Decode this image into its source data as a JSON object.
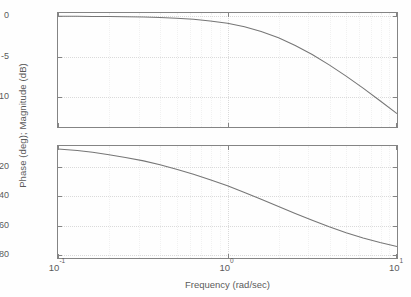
{
  "figure": {
    "ylabel": "Phase (deg); Magnitude (dB)",
    "xlabel": "Frequency (rad/sec)"
  },
  "xticks": [
    {
      "mantissa": "10",
      "exponent": "-1",
      "value": 0.1,
      "pos": 0.0
    },
    {
      "mantissa": "10",
      "exponent": "0",
      "value": 1.0,
      "pos": 0.5
    },
    {
      "mantissa": "10",
      "exponent": "1",
      "value": 10.0,
      "pos": 1.0
    }
  ],
  "magnitude": {
    "yticks": [
      "0",
      "-5",
      "-10"
    ],
    "ytick_values": [
      0,
      -5,
      -10
    ]
  },
  "phase": {
    "yticks": [
      "-20",
      "-40",
      "-60",
      "-80"
    ],
    "ytick_values": [
      -20,
      -40,
      -60,
      -80
    ]
  },
  "chart_data": {
    "type": "line",
    "title": "",
    "subtitle": "",
    "xlabel": "Frequency (rad/sec)",
    "ylabel": "Phase (deg); Magnitude (dB)",
    "xscale": "log",
    "xlim": [
      0.1,
      10
    ],
    "grid": true,
    "legend": "none",
    "panels": [
      {
        "name": "magnitude",
        "ylabel": "Magnitude (dB)",
        "ylim": [
          -13.7,
          0.4
        ],
        "yticks": [
          0,
          -5,
          -10
        ],
        "series": [
          {
            "name": "magnitude",
            "x": [
              0.1,
              0.13,
              0.16,
              0.2,
              0.25,
              0.32,
              0.4,
              0.5,
              0.63,
              0.79,
              1.0,
              1.26,
              1.58,
              2.0,
              2.51,
              3.16,
              3.98,
              5.01,
              6.31,
              7.94,
              10.0
            ],
            "y": [
              -0.01,
              -0.01,
              -0.02,
              -0.04,
              -0.06,
              -0.1,
              -0.15,
              -0.24,
              -0.37,
              -0.58,
              -0.88,
              -1.31,
              -1.9,
              -2.67,
              -3.62,
              -4.74,
              -6.01,
              -7.41,
              -8.9,
              -10.45,
              -12.05
            ]
          }
        ]
      },
      {
        "name": "phase",
        "ylabel": "Phase (deg)",
        "ylim": [
          -82,
          -6
        ],
        "yticks": [
          -20,
          -40,
          -60,
          -80
        ],
        "series": [
          {
            "name": "phase",
            "x": [
              0.1,
              0.13,
              0.16,
              0.2,
              0.25,
              0.32,
              0.4,
              0.5,
              0.63,
              0.79,
              1.0,
              1.26,
              1.58,
              2.0,
              2.51,
              3.16,
              3.98,
              5.01,
              6.31,
              7.94,
              10.0
            ],
            "y": [
              -8.0,
              -9.0,
              -10.3,
              -11.9,
              -13.8,
              -16.1,
              -18.7,
              -21.7,
              -25.1,
              -28.9,
              -33.0,
              -37.5,
              -42.2,
              -47.0,
              -51.8,
              -56.4,
              -60.8,
              -64.8,
              -68.4,
              -71.5,
              -74.2
            ]
          }
        ]
      }
    ]
  },
  "colors": {
    "curve": "#4a4a4a",
    "axis": "#5d5d5d",
    "grid": "#cfcfcf",
    "background": "#ffffff"
  }
}
